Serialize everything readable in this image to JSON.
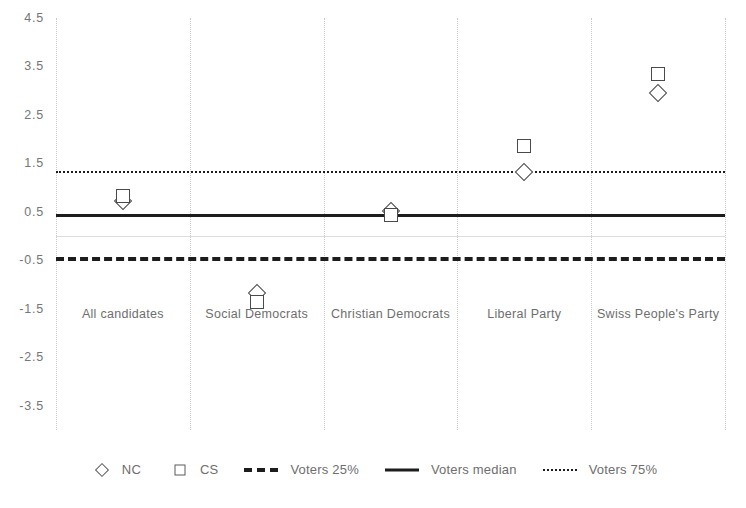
{
  "chart_data": {
    "type": "scatter",
    "title": "",
    "subtitle": "",
    "xlabel": "",
    "ylabel": "",
    "grid": "vertical-dotted",
    "legend_position": "bottom",
    "ylim": [
      -4.0,
      4.5
    ],
    "yticks": [
      "4.5",
      "3.5",
      "2.5",
      "1.5",
      "0.5",
      "-0.5",
      "-1.5",
      "-2.5",
      "-3.5"
    ],
    "ytick_values": [
      4.5,
      3.5,
      2.5,
      1.5,
      0.5,
      -0.5,
      -1.5,
      -2.5,
      -3.5
    ],
    "categories": [
      "All candidates",
      "Social Democrats",
      "Christian Democrats",
      "Liberal Party",
      "Swiss People's Party"
    ],
    "series": [
      {
        "name": "NC",
        "marker": "diamond",
        "values": [
          0.72,
          -1.18,
          0.52,
          1.32,
          2.95
        ]
      },
      {
        "name": "CS",
        "marker": "square",
        "values": [
          0.82,
          -1.35,
          0.43,
          1.85,
          3.35
        ]
      }
    ],
    "reference_lines": [
      {
        "name": "Voters 25%",
        "value": -0.44,
        "style": "dashed"
      },
      {
        "name": "Voters median",
        "value": 0.45,
        "style": "solid"
      },
      {
        "name": "Voters 75%",
        "value": 1.35,
        "style": "dotted"
      }
    ]
  },
  "legend": {
    "items": [
      {
        "label": "NC",
        "symbol": "diamond-marker"
      },
      {
        "label": "CS",
        "symbol": "square-marker"
      },
      {
        "label": "Voters 25%",
        "symbol": "dashed-line"
      },
      {
        "label": "Voters median",
        "symbol": "solid-line"
      },
      {
        "label": "Voters 75%",
        "symbol": "dotted-line"
      }
    ]
  }
}
